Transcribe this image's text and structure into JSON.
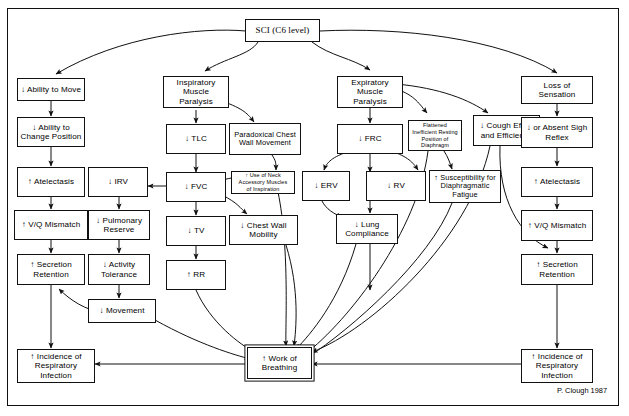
{
  "figure": {
    "credit": "P. Clough 1987",
    "frame_color": "#111111",
    "background": "#ffffff"
  },
  "nodes": {
    "sci": "SCI (C6 level)",
    "ability_move": "↓ Ability to Move",
    "change_position": "↓ Ability to\nChange Position",
    "atelectasis_left": "↑ Atelectasis",
    "vq_left": "↑ V/Q Mismatch",
    "secretion_left": "↑ Secretion\nRetention",
    "incidence_left": "↑ Incidence of\nRespiratory\nInfection",
    "irv": "↓ IRV",
    "pulmonary_reserve": "↓ Pulmonary\nReserve",
    "activity_tolerance": "↓ Activity\nTolerance",
    "movement": "↓ Movement",
    "insp_paralysis": "Inspiratory\nMuscle Paralysis",
    "tlc": "↓ TLC",
    "fvc": "↓ FVC",
    "tv": "↓ TV",
    "rr": "↑ RR",
    "paradoxical": "Paradoxical Chest\nWall Movement",
    "neck_muscles": "↑ Use of Neck\nAccessory Muscles\nof Inspiration",
    "chest_wall_mobility": "↓ Chest Wall\nMobility",
    "exp_paralysis": "Expiratory\nMuscle Paralysis",
    "frc": "↓ FRC",
    "erv": "↓ ERV",
    "rv": "↓ RV",
    "lung_compliance": "↓ Lung\nCompliance",
    "flattened_diaphragm": "Flattened\nInefficient Resting\nPosition of\nDiaphragm",
    "diaphragmatic_fatigue": "↑ Susceptibility for\nDiaphragmatic\nFatigue",
    "cough_effort": "↓ Cough Effort\nand Efficiency",
    "loss_sensation": "Loss of Sensation",
    "sigh_reflex": "↓ or Absent Sigh\nReflex",
    "atelectasis_right": "↑ Atelectasis",
    "vq_right": "↑ V/Q Mismatch",
    "secretion_right": "↑ Secretion\nRetention",
    "incidence_right": "↑ Incidence of\nRespiratory\nInfection",
    "work_breathing": "↑ Work of\nBreathing"
  },
  "edges": [
    {
      "from": "sci",
      "to": "ability_move"
    },
    {
      "from": "sci",
      "to": "insp_paralysis"
    },
    {
      "from": "sci",
      "to": "exp_paralysis"
    },
    {
      "from": "sci",
      "to": "loss_sensation"
    },
    {
      "from": "ability_move",
      "to": "change_position"
    },
    {
      "from": "change_position",
      "to": "atelectasis_left"
    },
    {
      "from": "atelectasis_left",
      "to": "vq_left"
    },
    {
      "from": "vq_left",
      "to": "secretion_left"
    },
    {
      "from": "secretion_left",
      "to": "incidence_left"
    },
    {
      "from": "insp_paralysis",
      "to": "tlc"
    },
    {
      "from": "insp_paralysis",
      "to": "paradoxical"
    },
    {
      "from": "tlc",
      "to": "fvc"
    },
    {
      "from": "fvc",
      "to": "irv"
    },
    {
      "from": "fvc",
      "to": "tv"
    },
    {
      "from": "fvc",
      "to": "neck_muscles"
    },
    {
      "from": "fvc",
      "to": "chest_wall_mobility"
    },
    {
      "from": "paradoxical",
      "to": "neck_muscles"
    },
    {
      "from": "irv",
      "to": "pulmonary_reserve"
    },
    {
      "from": "pulmonary_reserve",
      "to": "activity_tolerance"
    },
    {
      "from": "activity_tolerance",
      "to": "movement"
    },
    {
      "from": "movement",
      "to": "secretion_left"
    },
    {
      "from": "movement",
      "to": "work_breathing"
    },
    {
      "from": "tv",
      "to": "rr"
    },
    {
      "from": "rr",
      "to": "work_breathing"
    },
    {
      "from": "neck_muscles",
      "to": "work_breathing"
    },
    {
      "from": "chest_wall_mobility",
      "to": "work_breathing"
    },
    {
      "from": "exp_paralysis",
      "to": "frc"
    },
    {
      "from": "exp_paralysis",
      "to": "flattened_diaphragm"
    },
    {
      "from": "exp_paralysis",
      "to": "cough_effort"
    },
    {
      "from": "frc",
      "to": "erv"
    },
    {
      "from": "frc",
      "to": "rv"
    },
    {
      "from": "frc",
      "to": "lung_compliance"
    },
    {
      "from": "erv",
      "to": "lung_compliance"
    },
    {
      "from": "lung_compliance",
      "to": "work_breathing"
    },
    {
      "from": "flattened_diaphragm",
      "to": "diaphragmatic_fatigue"
    },
    {
      "from": "flattened_diaphragm",
      "to": "work_breathing"
    },
    {
      "from": "diaphragmatic_fatigue",
      "to": "work_breathing"
    },
    {
      "from": "cough_effort",
      "to": "secretion_right"
    },
    {
      "from": "cough_effort",
      "to": "work_breathing"
    },
    {
      "from": "loss_sensation",
      "to": "sigh_reflex"
    },
    {
      "from": "sigh_reflex",
      "to": "atelectasis_right"
    },
    {
      "from": "atelectasis_right",
      "to": "vq_right"
    },
    {
      "from": "vq_right",
      "to": "secretion_right"
    },
    {
      "from": "secretion_right",
      "to": "incidence_right"
    },
    {
      "from": "incidence_right",
      "to": "work_breathing"
    },
    {
      "from": "work_breathing",
      "to": "incidence_left"
    }
  ]
}
